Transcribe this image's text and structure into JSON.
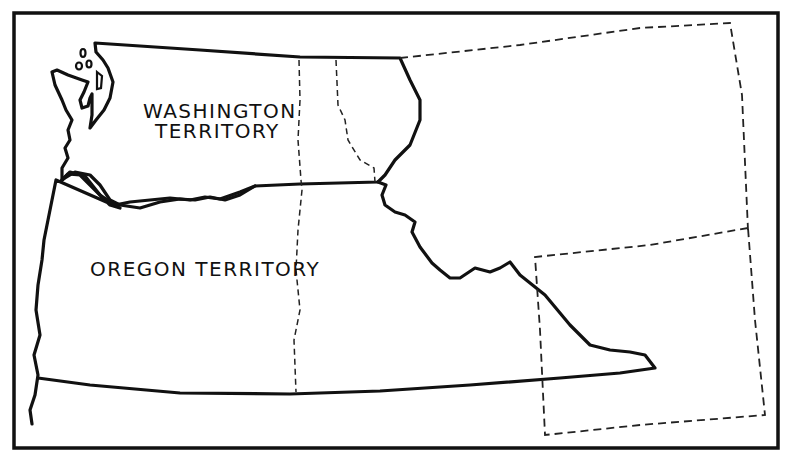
{
  "map": {
    "title": "",
    "labels": {
      "washington_line1": "WASHINGTON",
      "washington_line2": "TERRITORY",
      "oregon": "OREGON TERRITORY"
    },
    "colors": {
      "line": "#111111",
      "background": "#ffffff"
    },
    "regions": [
      {
        "name": "Washington Territory",
        "style": "solid outline"
      },
      {
        "name": "Oregon Territory",
        "style": "solid outline"
      },
      {
        "name": "Northeast extension",
        "style": "dashed outline"
      },
      {
        "name": "Southeast extension",
        "style": "dashed outline"
      }
    ]
  }
}
